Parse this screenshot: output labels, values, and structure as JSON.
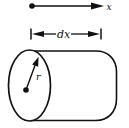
{
  "diagram": {
    "name": "cylinder-differential-element-figure",
    "background_color": "#ffffff",
    "ink_color": "#111111",
    "labels": {
      "axis": "x",
      "length": "dx",
      "radius": "r"
    },
    "elements": {
      "x_axis": "horizontal arrow from origin dot pointing right, labeled x",
      "dimension": "dimension line with outward arrowheads between end ticks, labeled dx",
      "cylinder": "horizontal cylinder with elliptical left face and radius arrow labeled r from center dot"
    }
  }
}
